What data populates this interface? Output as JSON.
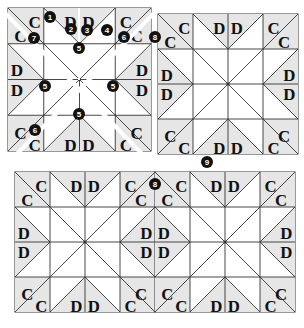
{
  "colors": {
    "background": "#ffffff",
    "shade": "#e6e6e6",
    "line": "#333333",
    "marker_fill": "#111111",
    "marker_text": "#ffffff"
  },
  "piece_labels": {
    "corner": "C",
    "edge": "D"
  },
  "markers": [
    {
      "id": "m1",
      "label": "1"
    },
    {
      "id": "m2",
      "label": "2"
    },
    {
      "id": "m3",
      "label": "3"
    },
    {
      "id": "m4",
      "label": "4"
    },
    {
      "id": "m5a",
      "label": "5"
    },
    {
      "id": "m5b",
      "label": "5"
    },
    {
      "id": "m5c",
      "label": "5"
    },
    {
      "id": "m5d",
      "label": "5"
    },
    {
      "id": "m6a",
      "label": "6"
    },
    {
      "id": "m6b",
      "label": "6"
    },
    {
      "id": "m7",
      "label": "7"
    },
    {
      "id": "m8a",
      "label": "8"
    },
    {
      "id": "m8b",
      "label": "8"
    },
    {
      "id": "m9",
      "label": "9"
    }
  ],
  "panels": [
    {
      "name": "panel-1-split-block",
      "blocks": 1
    },
    {
      "name": "panel-2-assembled-block",
      "blocks": 1
    },
    {
      "name": "panel-3-joined-blocks",
      "blocks": 2
    }
  ]
}
